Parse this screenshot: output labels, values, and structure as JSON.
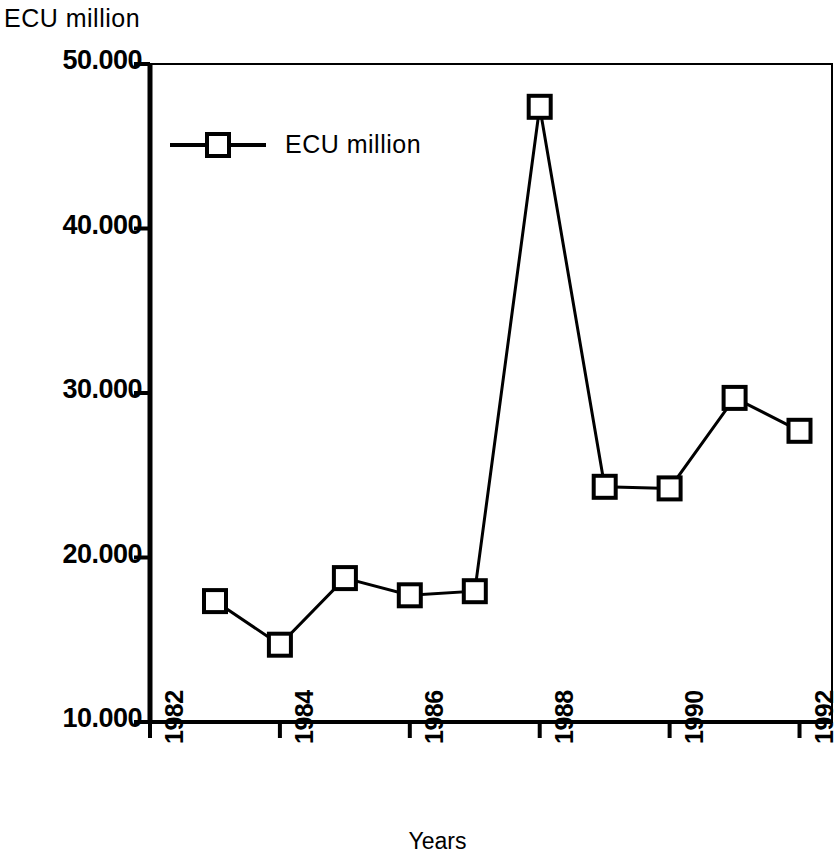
{
  "chart_data": {
    "type": "line",
    "title": "",
    "ylabel": "ECU million",
    "xlabel": "Years",
    "legend": [
      {
        "name": "ECU million",
        "marker": "open-square"
      }
    ],
    "legend_position": "top-left inside plot",
    "grid": false,
    "xlim": [
      1982,
      1992.5
    ],
    "ylim": [
      10000,
      50000
    ],
    "ytick_labels": [
      "50.000",
      "40.000",
      "30.000",
      "20.000",
      "10.000"
    ],
    "ytick_values": [
      50000,
      40000,
      30000,
      20000,
      10000
    ],
    "xtick_labels": [
      "1982",
      "1984",
      "1986",
      "1988",
      "1990",
      "1992"
    ],
    "xtick_values": [
      1982,
      1984,
      1986,
      1988,
      1990,
      1992
    ],
    "x": [
      1983,
      1984,
      1985,
      1986,
      1987,
      1988,
      1989,
      1990,
      1991,
      1992
    ],
    "series": [
      {
        "name": "ECU million",
        "values": [
          17350,
          14700,
          18750,
          17700,
          17950,
          47400,
          24300,
          24200,
          29700,
          27700
        ]
      }
    ]
  },
  "axis": {
    "y_title": "ECU million",
    "x_title": "Years"
  },
  "legend": {
    "entry_label": "ECU million"
  },
  "ticks": {
    "y": [
      {
        "label": "50.000"
      },
      {
        "label": "40.000"
      },
      {
        "label": "30.000"
      },
      {
        "label": "20.000"
      },
      {
        "label": "10.000"
      }
    ],
    "x": [
      {
        "label": "1982"
      },
      {
        "label": "1984"
      },
      {
        "label": "1986"
      },
      {
        "label": "1988"
      },
      {
        "label": "1990"
      },
      {
        "label": "1992"
      }
    ]
  },
  "style": {
    "ink": "#000000",
    "background": "#ffffff"
  }
}
